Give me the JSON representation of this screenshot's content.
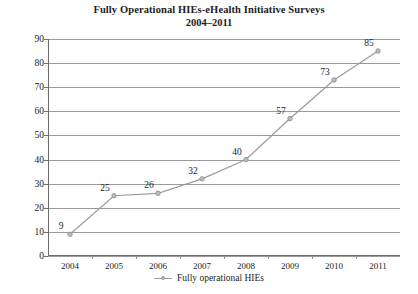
{
  "chart_data": {
    "type": "line",
    "title": "Fully Operational HIEs-eHealth Initiative Surveys",
    "subtitle": "2004–2011",
    "xlabel": "",
    "ylabel": "",
    "categories": [
      "2004",
      "2005",
      "2006",
      "2007",
      "2008",
      "2009",
      "2010",
      "2011"
    ],
    "values": [
      9,
      25,
      26,
      32,
      40,
      57,
      73,
      85
    ],
    "series": [
      {
        "name": "Fully operational HIEs",
        "values": [
          9,
          25,
          26,
          32,
          40,
          57,
          73,
          85
        ]
      }
    ],
    "data_labels": [
      "9",
      "25",
      "26",
      "32",
      "40",
      "57",
      "73",
      "85"
    ],
    "ylim": [
      0,
      90
    ],
    "y_ticks": [
      0,
      10,
      20,
      30,
      40,
      50,
      60,
      70,
      80,
      90
    ],
    "y_tick_labels": [
      "0",
      "10",
      "20",
      "30",
      "40",
      "50",
      "60",
      "70",
      "80",
      "90"
    ],
    "grid": true,
    "grid_axis": "y",
    "legend": [
      "Fully operational HIEs"
    ],
    "legend_position": "bottom",
    "colors": {
      "line": "#9b9b9b",
      "marker_fill": "#bdbdbd",
      "marker_stroke": "#8f8f8f",
      "grid": "#9a9a9a",
      "axis": "#6e6e6e",
      "text": "#1c1c1c",
      "background": "#ffffff"
    }
  },
  "legend": {
    "entry_label": "Fully operational HIEs",
    "marker_icon": "line-marker-icon"
  }
}
